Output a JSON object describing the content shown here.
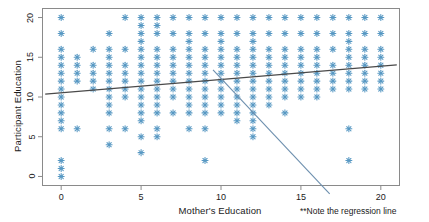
{
  "chart_data": {
    "type": "scatter",
    "title": "",
    "xlabel": "Mother's Education",
    "ylabel": "Participant Education",
    "xlim": [
      -1.2,
      21.2
    ],
    "ylim": [
      -1.2,
      21.2
    ],
    "xticks": [
      0,
      5,
      10,
      15,
      20
    ],
    "yticks": [
      0,
      5,
      10,
      15,
      20
    ],
    "grid": false,
    "legend": null,
    "marker": "asterisk",
    "marker_color": "#4f93c0",
    "points": [
      [
        0,
        0
      ],
      [
        0,
        1
      ],
      [
        0,
        2
      ],
      [
        0,
        6
      ],
      [
        0,
        7
      ],
      [
        0,
        8
      ],
      [
        0,
        9
      ],
      [
        0,
        10
      ],
      [
        0,
        11
      ],
      [
        0,
        12
      ],
      [
        0,
        13
      ],
      [
        0,
        14
      ],
      [
        0,
        15
      ],
      [
        0,
        16
      ],
      [
        0,
        18
      ],
      [
        0,
        20
      ],
      [
        1,
        6
      ],
      [
        1,
        12
      ],
      [
        1,
        13
      ],
      [
        1,
        14
      ],
      [
        1,
        15
      ],
      [
        2,
        11
      ],
      [
        2,
        12
      ],
      [
        2,
        13
      ],
      [
        2,
        14
      ],
      [
        2,
        16
      ],
      [
        3,
        4
      ],
      [
        3,
        6
      ],
      [
        3,
        8
      ],
      [
        3,
        9
      ],
      [
        3,
        10
      ],
      [
        3,
        11
      ],
      [
        3,
        12
      ],
      [
        3,
        13
      ],
      [
        3,
        14
      ],
      [
        3,
        15
      ],
      [
        3,
        16
      ],
      [
        3,
        18
      ],
      [
        4,
        6
      ],
      [
        4,
        10
      ],
      [
        4,
        11
      ],
      [
        4,
        12
      ],
      [
        4,
        13
      ],
      [
        4,
        14
      ],
      [
        4,
        16
      ],
      [
        4,
        20
      ],
      [
        5,
        3
      ],
      [
        5,
        5
      ],
      [
        5,
        7
      ],
      [
        5,
        8
      ],
      [
        5,
        9
      ],
      [
        5,
        10
      ],
      [
        5,
        11
      ],
      [
        5,
        12
      ],
      [
        5,
        13
      ],
      [
        5,
        14
      ],
      [
        5,
        15
      ],
      [
        5,
        16
      ],
      [
        5,
        17
      ],
      [
        5,
        18
      ],
      [
        5,
        19
      ],
      [
        5,
        20
      ],
      [
        6,
        5
      ],
      [
        6,
        6
      ],
      [
        6,
        8
      ],
      [
        6,
        9
      ],
      [
        6,
        10
      ],
      [
        6,
        11
      ],
      [
        6,
        12
      ],
      [
        6,
        13
      ],
      [
        6,
        14
      ],
      [
        6,
        15
      ],
      [
        6,
        16
      ],
      [
        6,
        18
      ],
      [
        6,
        19
      ],
      [
        6,
        20
      ],
      [
        7,
        8
      ],
      [
        7,
        10
      ],
      [
        7,
        11
      ],
      [
        7,
        12
      ],
      [
        7,
        13
      ],
      [
        7,
        14
      ],
      [
        7,
        15
      ],
      [
        7,
        16
      ],
      [
        7,
        18
      ],
      [
        7,
        20
      ],
      [
        8,
        6
      ],
      [
        8,
        8
      ],
      [
        8,
        9
      ],
      [
        8,
        10
      ],
      [
        8,
        11
      ],
      [
        8,
        12
      ],
      [
        8,
        13
      ],
      [
        8,
        14
      ],
      [
        8,
        15
      ],
      [
        8,
        16
      ],
      [
        8,
        17
      ],
      [
        8,
        18
      ],
      [
        8,
        20
      ],
      [
        9,
        2
      ],
      [
        9,
        6
      ],
      [
        9,
        8
      ],
      [
        9,
        9
      ],
      [
        9,
        10
      ],
      [
        9,
        11
      ],
      [
        9,
        12
      ],
      [
        9,
        13
      ],
      [
        9,
        14
      ],
      [
        9,
        15
      ],
      [
        9,
        16
      ],
      [
        9,
        18
      ],
      [
        9,
        20
      ],
      [
        10,
        8
      ],
      [
        10,
        9
      ],
      [
        10,
        10
      ],
      [
        10,
        11
      ],
      [
        10,
        12
      ],
      [
        10,
        13
      ],
      [
        10,
        14
      ],
      [
        10,
        15
      ],
      [
        10,
        16
      ],
      [
        10,
        17
      ],
      [
        10,
        18
      ],
      [
        10,
        20
      ],
      [
        11,
        7
      ],
      [
        11,
        8
      ],
      [
        11,
        9
      ],
      [
        11,
        10
      ],
      [
        11,
        11
      ],
      [
        11,
        12
      ],
      [
        11,
        13
      ],
      [
        11,
        14
      ],
      [
        11,
        15
      ],
      [
        11,
        16
      ],
      [
        11,
        18
      ],
      [
        11,
        20
      ],
      [
        12,
        5
      ],
      [
        12,
        6
      ],
      [
        12,
        7
      ],
      [
        12,
        8
      ],
      [
        12,
        9
      ],
      [
        12,
        10
      ],
      [
        12,
        11
      ],
      [
        12,
        12
      ],
      [
        12,
        13
      ],
      [
        12,
        14
      ],
      [
        12,
        15
      ],
      [
        12,
        16
      ],
      [
        12,
        17
      ],
      [
        12,
        18
      ],
      [
        12,
        20
      ],
      [
        13,
        9
      ],
      [
        13,
        10
      ],
      [
        13,
        11
      ],
      [
        13,
        12
      ],
      [
        13,
        13
      ],
      [
        13,
        14
      ],
      [
        13,
        15
      ],
      [
        13,
        16
      ],
      [
        13,
        18
      ],
      [
        13,
        20
      ],
      [
        14,
        8
      ],
      [
        14,
        10
      ],
      [
        14,
        11
      ],
      [
        14,
        12
      ],
      [
        14,
        13
      ],
      [
        14,
        14
      ],
      [
        14,
        15
      ],
      [
        14,
        16
      ],
      [
        14,
        18
      ],
      [
        14,
        20
      ],
      [
        15,
        10
      ],
      [
        15,
        11
      ],
      [
        15,
        12
      ],
      [
        15,
        13
      ],
      [
        15,
        14
      ],
      [
        15,
        15
      ],
      [
        15,
        16
      ],
      [
        15,
        18
      ],
      [
        15,
        20
      ],
      [
        16,
        10
      ],
      [
        16,
        11
      ],
      [
        16,
        12
      ],
      [
        16,
        13
      ],
      [
        16,
        14
      ],
      [
        16,
        15
      ],
      [
        16,
        16
      ],
      [
        16,
        18
      ],
      [
        16,
        20
      ],
      [
        17,
        11
      ],
      [
        17,
        12
      ],
      [
        17,
        13
      ],
      [
        17,
        14
      ],
      [
        17,
        16
      ],
      [
        17,
        18
      ],
      [
        17,
        20
      ],
      [
        18,
        2
      ],
      [
        18,
        6
      ],
      [
        18,
        11
      ],
      [
        18,
        12
      ],
      [
        18,
        13
      ],
      [
        18,
        14
      ],
      [
        18,
        15
      ],
      [
        18,
        16
      ],
      [
        18,
        17
      ],
      [
        18,
        18
      ],
      [
        18,
        20
      ],
      [
        19,
        11
      ],
      [
        19,
        12
      ],
      [
        19,
        13
      ],
      [
        19,
        14
      ],
      [
        19,
        15
      ],
      [
        19,
        16
      ],
      [
        19,
        18
      ],
      [
        19,
        20
      ],
      [
        20,
        11
      ],
      [
        20,
        12
      ],
      [
        20,
        13
      ],
      [
        20,
        14
      ],
      [
        20,
        15
      ],
      [
        20,
        16
      ],
      [
        20,
        18
      ],
      [
        20,
        20
      ]
    ],
    "regression_line": {
      "color": "#4a4a4a",
      "x_start": -1.0,
      "y_start": 10.35,
      "x_end": 21.0,
      "y_end": 14.05
    },
    "annotation": {
      "text": "**Note the regression line",
      "color": "#1a1a1a",
      "pointer_color": "#6d8fae",
      "pointer": {
        "x_start": 9.5,
        "y_start": 13.4,
        "x_end": 16.8,
        "y_end": -2.2
      }
    }
  }
}
